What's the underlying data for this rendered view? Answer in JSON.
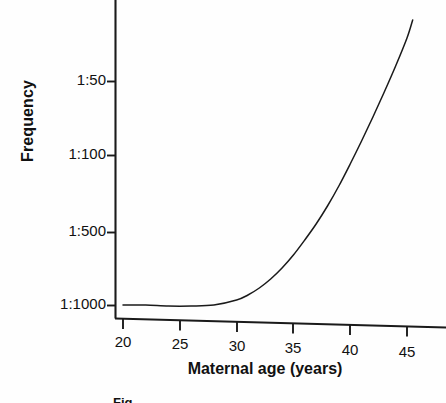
{
  "figure": {
    "kind": "scientific-line-chart",
    "background_color": "#fefefe",
    "ink_color": "#111111"
  },
  "axis": {
    "y_title": "Frequency",
    "x_title": "Maternal age (years)",
    "y_tick_labels": [
      "1:50",
      "1:100",
      "1:500",
      "1:1000"
    ],
    "x_tick_labels": [
      "20",
      "25",
      "30",
      "35",
      "40",
      "45"
    ]
  },
  "caption": {
    "cropped_text": "Fig."
  },
  "chart_data": {
    "type": "line",
    "title": "",
    "subtitle": "",
    "xlabel": "Maternal age (years)",
    "ylabel": "Frequency",
    "xlim": [
      20,
      46.5
    ],
    "ylim_labels_bottom_to_top": [
      "1:1000",
      "1:500",
      "1:100",
      "1:50"
    ],
    "y_scale": "non-linear frequency scale (1:N, larger risk upward)",
    "x_ticks": [
      20,
      25,
      30,
      35,
      40,
      45
    ],
    "y_ticks": [
      "1:1000",
      "1:500",
      "1:100",
      "1:50"
    ],
    "grid": false,
    "legend": null,
    "legend_position": "none",
    "annotations": [],
    "series": [
      {
        "name": "Down syndrome frequency vs maternal age",
        "x": [
          20,
          22,
          24,
          26,
          28,
          30,
          31,
          32,
          33,
          34,
          35,
          36,
          37,
          38,
          39,
          40,
          41,
          42,
          43,
          44,
          45,
          45.5
        ],
        "y_label_values": [
          "1:1000",
          "1:1000",
          "1:1000",
          "1:1000",
          "1:1050",
          "1:1000",
          "1:900",
          "1:800",
          "1:700",
          "1:600",
          "1:500",
          "1:420",
          "1:350",
          "1:280",
          "1:220",
          "1:170",
          "1:130",
          "1:105",
          "1:85",
          "1:68",
          "1:55",
          "1:48"
        ],
        "y_pixels_top_origin": [
          305,
          305,
          306,
          306,
          305,
          300,
          295,
          288,
          279,
          268,
          255,
          240,
          224,
          206,
          186,
          164,
          141,
          117,
          92,
          66,
          38,
          20
        ],
        "style": "solid",
        "color": "#111111",
        "width": 1.4
      }
    ]
  },
  "geometry": {
    "plot_left_px": 115,
    "plot_bottom_px": 318,
    "plot_right_px": 446,
    "plot_top_px": 0,
    "y_tick_pixels": {
      "1:50": 81,
      "1:100": 155,
      "1:500": 232,
      "1:1000": 305
    },
    "x_tick_pixels": {
      "20": 123,
      "25": 180,
      "30": 237,
      "35": 293,
      "40": 350,
      "45": 407
    }
  }
}
